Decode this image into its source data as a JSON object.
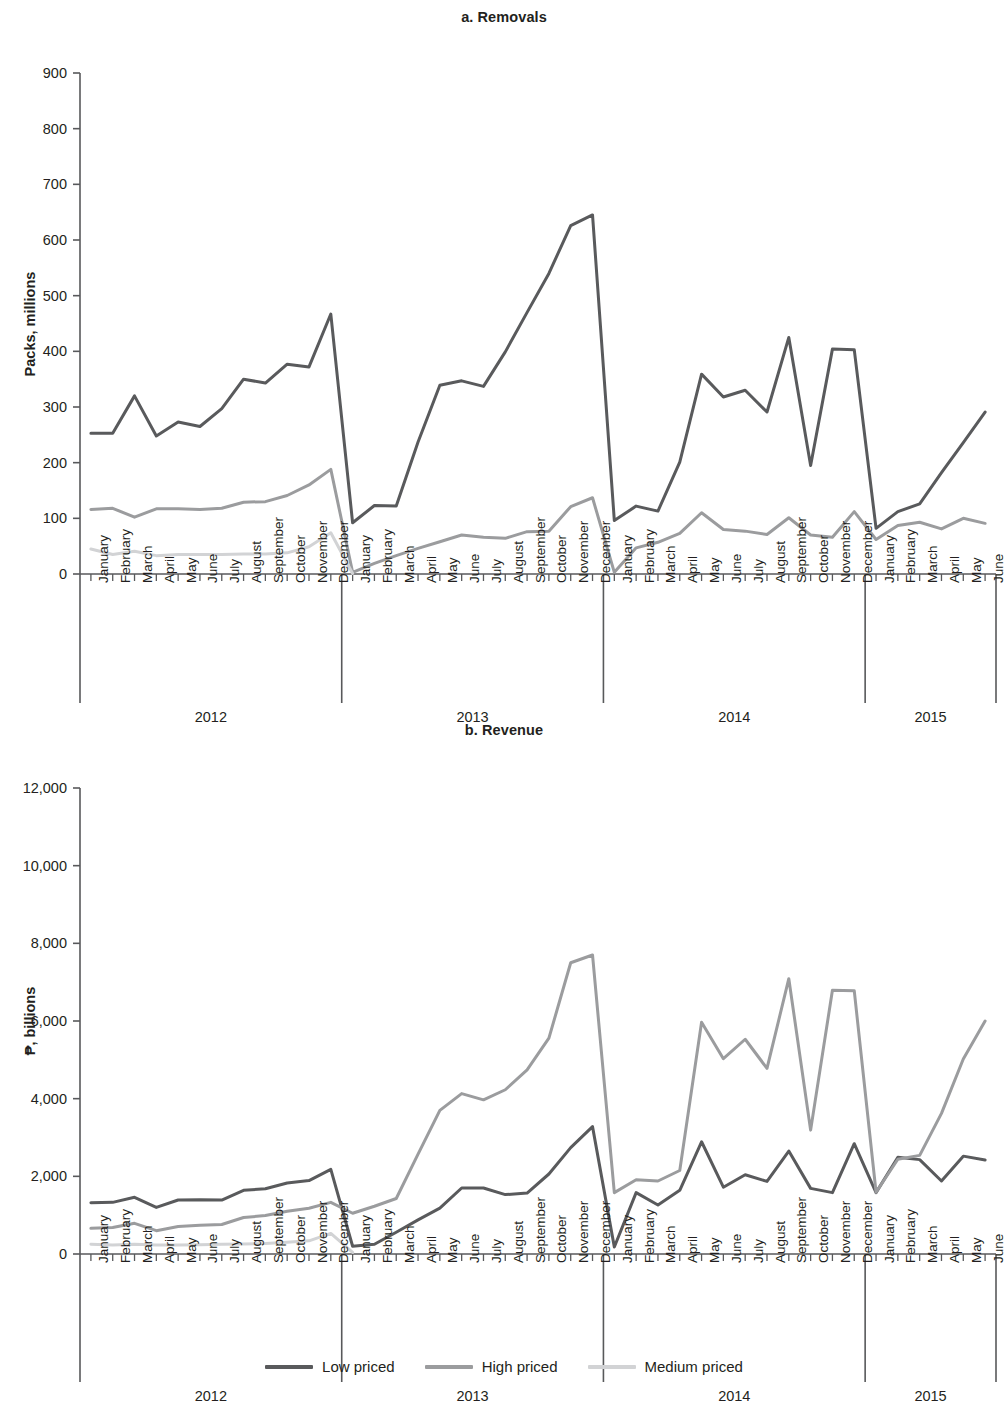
{
  "figure": {
    "legend": [
      {
        "label": "Low priced",
        "color": "#595a5c"
      },
      {
        "label": "High priced",
        "color": "#9b9c9e"
      },
      {
        "label": "Medium priced",
        "color": "#d2d3d5"
      }
    ],
    "years": [
      "2012",
      "2013",
      "2014",
      "2015"
    ],
    "months_full": [
      "January",
      "February",
      "March",
      "April",
      "May",
      "June",
      "July",
      "August",
      "September",
      "October",
      "November",
      "December"
    ],
    "months_2015": [
      "January",
      "February",
      "March",
      "April",
      "May",
      "June"
    ]
  },
  "chart_data": [
    {
      "id": "a",
      "type": "line",
      "title": "a. Removals",
      "xlabel": "",
      "ylabel": "Packs, millions",
      "ylim": [
        0,
        900
      ],
      "ytick_step": 100,
      "yticks": [
        0,
        100,
        200,
        300,
        400,
        500,
        600,
        700,
        800,
        900
      ],
      "ytick_labels": [
        "0",
        "100",
        "200",
        "300",
        "400",
        "500",
        "600",
        "700",
        "800",
        "900"
      ],
      "grid": false,
      "legend_position": "bottom",
      "x": [
        "2012-January",
        "2012-February",
        "2012-March",
        "2012-April",
        "2012-May",
        "2012-June",
        "2012-July",
        "2012-August",
        "2012-September",
        "2012-October",
        "2012-November",
        "2012-December",
        "2013-January",
        "2013-February",
        "2013-March",
        "2013-April",
        "2013-May",
        "2013-June",
        "2013-July",
        "2013-August",
        "2013-September",
        "2013-October",
        "2013-November",
        "2013-December",
        "2014-January",
        "2014-February",
        "2014-March",
        "2014-April",
        "2014-May",
        "2014-June",
        "2014-July",
        "2014-August",
        "2014-September",
        "2014-October",
        "2014-November",
        "2014-December",
        "2015-January",
        "2015-February",
        "2015-March",
        "2015-April",
        "2015-May",
        "2015-June"
      ],
      "series": [
        {
          "name": "Low priced",
          "color": "#595a5c",
          "values": [
            253,
            253,
            320,
            248,
            273,
            265,
            297,
            350,
            343,
            377,
            372,
            467,
            92,
            123,
            122,
            237,
            339,
            347,
            337,
            399,
            470,
            540,
            626,
            645,
            96,
            122,
            113,
            201,
            359,
            318,
            330,
            291,
            425,
            195,
            404,
            403,
            82,
            112,
            126,
            182,
            236,
            291
          ]
        },
        {
          "name": "High priced",
          "color": "#9b9c9e",
          "values": [
            116,
            118,
            102,
            117,
            117,
            116,
            118,
            129,
            130,
            141,
            160,
            188,
            3,
            19,
            33,
            46,
            58,
            70,
            66,
            64,
            76,
            77,
            121,
            137,
            3,
            47,
            57,
            73,
            110,
            80,
            77,
            71,
            101,
            70,
            66,
            112,
            62,
            87,
            93,
            81,
            100,
            91
          ]
        },
        {
          "name": "Medium priced",
          "color": "#d2d3d5",
          "values": [
            45,
            35,
            41,
            33,
            35,
            35,
            35,
            36,
            36,
            38,
            49,
            74,
            1,
            null,
            null,
            null,
            null,
            null,
            null,
            null,
            null,
            null,
            null,
            null,
            null,
            null,
            null,
            null,
            null,
            null,
            null,
            null,
            null,
            null,
            null,
            null,
            null,
            null,
            null,
            null,
            null,
            null
          ]
        }
      ]
    },
    {
      "id": "b",
      "type": "line",
      "title": "b. Revenue",
      "xlabel": "",
      "ylabel": "₱, billions",
      "ylim": [
        0,
        12000
      ],
      "ytick_step": 2000,
      "yticks": [
        0,
        2000,
        4000,
        6000,
        8000,
        10000,
        12000
      ],
      "ytick_labels": [
        "0",
        "2,000",
        "4,000",
        "6,000",
        "8,000",
        "10,000",
        "12,000"
      ],
      "grid": false,
      "legend_position": "bottom",
      "x": [
        "2012-January",
        "2012-February",
        "2012-March",
        "2012-April",
        "2012-May",
        "2012-June",
        "2012-July",
        "2012-August",
        "2012-September",
        "2012-October",
        "2012-November",
        "2012-December",
        "2013-January",
        "2013-February",
        "2013-March",
        "2013-April",
        "2013-May",
        "2013-June",
        "2013-July",
        "2013-August",
        "2013-September",
        "2013-October",
        "2013-November",
        "2013-December",
        "2014-January",
        "2014-February",
        "2014-March",
        "2014-April",
        "2014-May",
        "2014-June",
        "2014-July",
        "2014-August",
        "2014-September",
        "2014-October",
        "2014-November",
        "2014-December",
        "2015-January",
        "2015-February",
        "2015-March",
        "2015-April",
        "2015-May",
        "2015-June"
      ],
      "series": [
        {
          "name": "Low priced",
          "color": "#595a5c",
          "values": [
            1320,
            1330,
            1460,
            1200,
            1390,
            1400,
            1390,
            1640,
            1680,
            1830,
            1890,
            2180,
            200,
            250,
            560,
            880,
            1180,
            1700,
            1700,
            1530,
            1570,
            2060,
            2740,
            3280,
            180,
            1580,
            1260,
            1640,
            2890,
            1720,
            2040,
            1870,
            2650,
            1690,
            1580,
            2840,
            1580,
            2490,
            2430,
            1880,
            2520,
            2420
          ]
        },
        {
          "name": "High priced",
          "color": "#9b9c9e",
          "values": [
            660,
            680,
            790,
            600,
            710,
            740,
            760,
            940,
            990,
            1100,
            1180,
            1330,
            1050,
            1230,
            1430,
            2570,
            3700,
            4130,
            3970,
            4230,
            4740,
            5560,
            7500,
            7700,
            1580,
            1910,
            1880,
            2150,
            5970,
            5030,
            5530,
            4780,
            7090,
            3190,
            6790,
            6780,
            1590,
            2440,
            2540,
            3620,
            5020,
            6000
          ]
        },
        {
          "name": "Medium priced",
          "color": "#d2d3d5",
          "values": [
            250,
            230,
            250,
            230,
            230,
            240,
            250,
            260,
            270,
            300,
            340,
            530,
            40,
            null,
            null,
            null,
            null,
            null,
            null,
            null,
            null,
            null,
            null,
            null,
            null,
            null,
            null,
            null,
            null,
            null,
            null,
            null,
            null,
            null,
            null,
            null,
            null,
            null,
            null,
            null,
            null,
            null
          ]
        }
      ]
    }
  ]
}
